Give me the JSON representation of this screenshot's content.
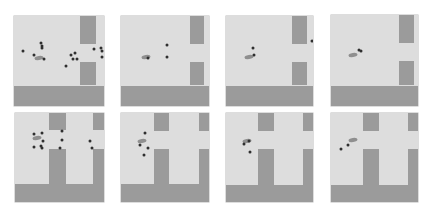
{
  "figure": {
    "rows": 2,
    "cols": 4,
    "colors": {
      "background": "#ffffff",
      "floor": "#dddddd",
      "wall": "#9b9b9b",
      "agent": "#8f8f8f",
      "particle": "#2f2f2f"
    },
    "panels": [
      {
        "id": "r1c1",
        "box": [
          14,
          16,
          90,
          90
        ],
        "walls": [
          [
            73,
            0,
            18,
            31
          ],
          [
            73,
            51,
            18,
            26
          ],
          [
            0,
            78,
            100,
            22
          ]
        ],
        "agent": [
          28,
          47
        ],
        "particles": [
          [
            10,
            39
          ],
          [
            30,
            30
          ],
          [
            31,
            33
          ],
          [
            31,
            35
          ],
          [
            22,
            43
          ],
          [
            33,
            48
          ],
          [
            63,
            43
          ],
          [
            68,
            41
          ],
          [
            66,
            48
          ],
          [
            70,
            48
          ],
          [
            58,
            55
          ],
          [
            89,
            37
          ],
          [
            97,
            35
          ],
          [
            98,
            39
          ],
          [
            98,
            45
          ]
        ]
      },
      {
        "id": "r1c2",
        "box": [
          121,
          16,
          88,
          90
        ],
        "walls": [
          [
            78,
            0,
            16,
            31
          ],
          [
            78,
            51,
            16,
            26
          ],
          [
            0,
            78,
            100,
            22
          ]
        ],
        "agent": [
          28,
          46
        ],
        "particles": [
          [
            31,
            47
          ],
          [
            52,
            32
          ],
          [
            52,
            45
          ]
        ]
      },
      {
        "id": "r1c3",
        "box": [
          226,
          16,
          87,
          90
        ],
        "walls": [
          [
            76,
            0,
            17,
            31
          ],
          [
            76,
            51,
            17,
            26
          ],
          [
            0,
            78,
            100,
            22
          ]
        ],
        "agent": [
          26,
          45
        ],
        "particles": [
          [
            31,
            35
          ],
          [
            32,
            43
          ],
          [
            99,
            28
          ]
        ]
      },
      {
        "id": "r1c4",
        "box": [
          331,
          15,
          87,
          91
        ],
        "walls": [
          [
            78,
            0,
            17,
            31
          ],
          [
            78,
            51,
            17,
            26
          ],
          [
            0,
            78,
            100,
            22
          ]
        ],
        "agent": [
          25,
          44
        ],
        "particles": [
          [
            32,
            39
          ],
          [
            34,
            40
          ]
        ]
      },
      {
        "id": "r2c1",
        "box": [
          15,
          113,
          89,
          89
        ],
        "walls": [
          [
            38,
            0,
            19,
            19
          ],
          [
            88,
            0,
            12,
            19
          ],
          [
            38,
            40,
            19,
            42
          ],
          [
            88,
            40,
            12,
            42
          ],
          [
            0,
            80,
            100,
            20
          ]
        ],
        "agent": [
          25,
          28
        ],
        "particles": [
          [
            21,
            24
          ],
          [
            30,
            22
          ],
          [
            32,
            31
          ],
          [
            21,
            38
          ],
          [
            29,
            37
          ],
          [
            30,
            39
          ],
          [
            53,
            20
          ],
          [
            53,
            30
          ],
          [
            51,
            39
          ],
          [
            84,
            32
          ],
          [
            87,
            39
          ]
        ]
      },
      {
        "id": "r2c2",
        "box": [
          121,
          113,
          88,
          89
        ],
        "walls": [
          [
            37,
            0,
            18,
            20
          ],
          [
            89,
            0,
            11,
            20
          ],
          [
            37,
            41,
            18,
            41
          ],
          [
            89,
            41,
            11,
            41
          ],
          [
            0,
            80,
            100,
            20
          ]
        ],
        "agent": [
          24,
          32
        ],
        "particles": [
          [
            22,
            36
          ],
          [
            27,
            23
          ],
          [
            31,
            39
          ],
          [
            26,
            47
          ]
        ]
      },
      {
        "id": "r2c3",
        "box": [
          226,
          113,
          87,
          89
        ],
        "walls": [
          [
            37,
            0,
            18,
            20
          ],
          [
            89,
            0,
            11,
            20
          ],
          [
            37,
            41,
            18,
            41
          ],
          [
            89,
            41,
            11,
            41
          ],
          [
            0,
            81,
            100,
            19
          ]
        ],
        "agent": [
          24,
          32
        ],
        "particles": [
          [
            21,
            35
          ],
          [
            27,
            31
          ],
          [
            28,
            44
          ]
        ]
      },
      {
        "id": "r2c4",
        "box": [
          331,
          113,
          87,
          89
        ],
        "walls": [
          [
            37,
            0,
            18,
            20
          ],
          [
            89,
            0,
            11,
            20
          ],
          [
            37,
            41,
            18,
            41
          ],
          [
            89,
            41,
            11,
            41
          ],
          [
            0,
            81,
            100,
            19
          ]
        ],
        "agent": [
          25,
          30
        ],
        "particles": [
          [
            12,
            41
          ],
          [
            20,
            36
          ]
        ]
      }
    ]
  }
}
